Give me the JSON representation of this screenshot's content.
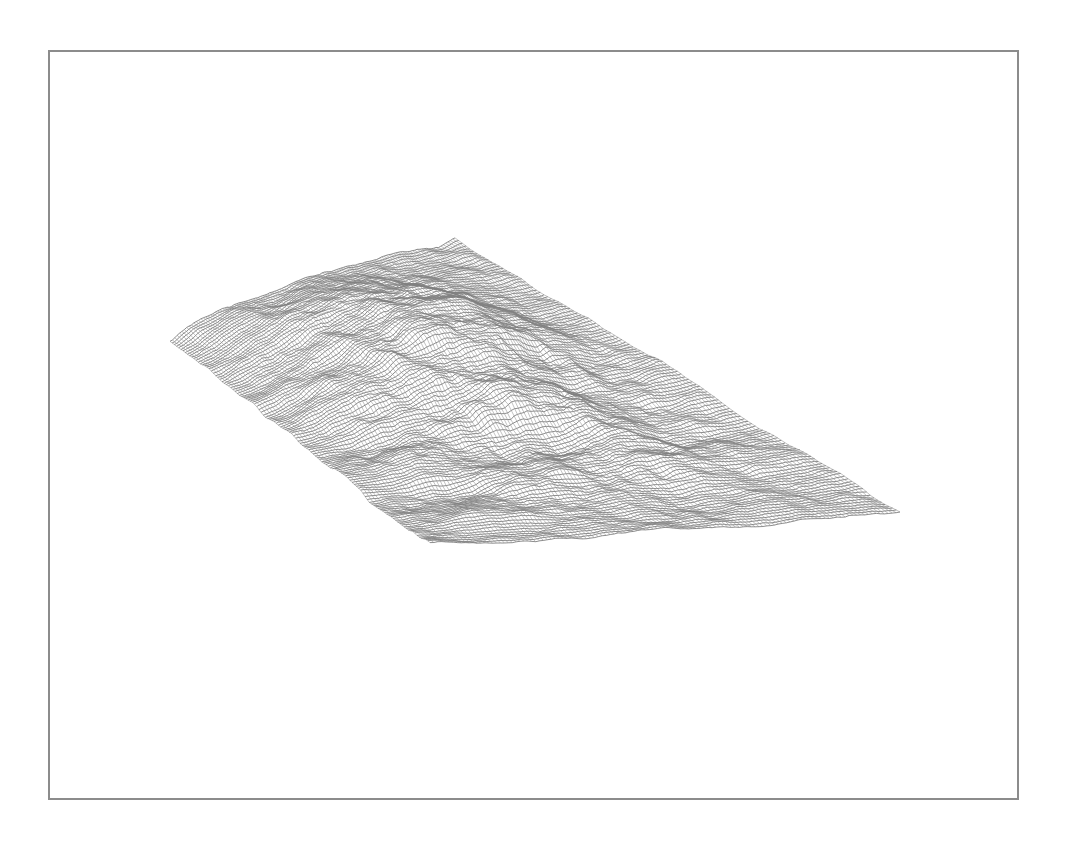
{
  "chart_data": {
    "type": "surface-wireframe",
    "title": "",
    "xlabel": "",
    "ylabel": "",
    "zlabel": "",
    "axes_visible": false,
    "grid": false,
    "legend": null,
    "mesh_color": "#808080",
    "background": "#ffffff",
    "frame_color": "#8c8c8c",
    "grid_resolution": [
      120,
      60
    ],
    "projection": {
      "left_tip": [
        170,
        335
      ],
      "far_tip": [
        455,
        240
      ],
      "right_tip": [
        900,
        512
      ],
      "near_tip": [
        430,
        548
      ]
    }
  }
}
